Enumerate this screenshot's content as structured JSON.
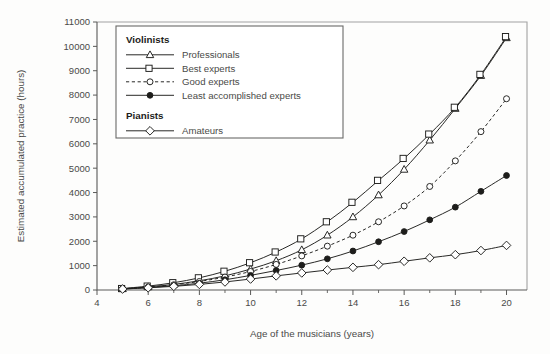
{
  "chart_data": {
    "type": "line",
    "title": "",
    "xlabel": "Age of the musicians (years)",
    "ylabel": "Estimated accumulated practice (hours)",
    "xlim": [
      4,
      20.8
    ],
    "ylim": [
      0,
      11000
    ],
    "grid": false,
    "legend_position": "top-left-inside",
    "x": [
      5,
      6,
      7,
      8,
      9,
      10,
      11,
      12,
      13,
      14,
      15,
      16,
      17,
      18,
      19,
      20
    ],
    "xticks_major": [
      4,
      6,
      8,
      10,
      12,
      14,
      16,
      18,
      20
    ],
    "xticks_minor": [
      5,
      7,
      9,
      11,
      13,
      15,
      17,
      19
    ],
    "yticks": [
      0,
      1000,
      2000,
      3000,
      4000,
      5000,
      6000,
      7000,
      8000,
      9000,
      10000,
      11000
    ],
    "series": [
      {
        "name": "Professionals",
        "group": "Violinists",
        "marker": "triangle-open",
        "linestyle": "solid",
        "values": [
          50,
          130,
          230,
          380,
          580,
          860,
          1200,
          1650,
          2250,
          3000,
          3900,
          4950,
          6150,
          7450,
          8800,
          10350
        ]
      },
      {
        "name": "Best experts",
        "group": "Violinists",
        "marker": "square-open",
        "linestyle": "solid",
        "values": [
          60,
          160,
          300,
          500,
          770,
          1120,
          1560,
          2100,
          2800,
          3600,
          4500,
          5400,
          6400,
          7500,
          8850,
          10400
        ]
      },
      {
        "name": "Good experts",
        "group": "Violinists",
        "marker": "circle-open",
        "linestyle": "dashed",
        "values": [
          50,
          120,
          215,
          350,
          530,
          760,
          1050,
          1400,
          1800,
          2250,
          2800,
          3450,
          4250,
          5300,
          6500,
          7850
        ]
      },
      {
        "name": "Least accomplished experts",
        "group": "Violinists",
        "marker": "circle-filled",
        "linestyle": "solid",
        "values": [
          40,
          100,
          175,
          280,
          420,
          600,
          800,
          1020,
          1280,
          1600,
          1980,
          2400,
          2880,
          3400,
          4050,
          4700
        ]
      },
      {
        "name": "Amateurs",
        "group": "Pianists",
        "marker": "diamond-open",
        "linestyle": "solid",
        "values": [
          40,
          90,
          150,
          230,
          330,
          450,
          580,
          700,
          820,
          930,
          1040,
          1180,
          1320,
          1450,
          1620,
          1830
        ]
      }
    ]
  },
  "legend": {
    "groups": [
      {
        "heading": "Violinists",
        "entries": [
          {
            "label": "Professionals",
            "marker": "triangle-open",
            "linestyle": "solid"
          },
          {
            "label": "Best experts",
            "marker": "square-open",
            "linestyle": "solid"
          },
          {
            "label": "Good experts",
            "marker": "circle-open",
            "linestyle": "dashed"
          },
          {
            "label": "Least accomplished experts",
            "marker": "circle-filled",
            "linestyle": "solid"
          }
        ]
      },
      {
        "heading": "Pianists",
        "entries": [
          {
            "label": "Amateurs",
            "marker": "diamond-open",
            "linestyle": "solid"
          }
        ]
      }
    ]
  },
  "colors": {
    "ink": "#1d1d1b",
    "axis": "#5a5a58",
    "text": "#4a4a48",
    "background": "#fdfdfc"
  }
}
